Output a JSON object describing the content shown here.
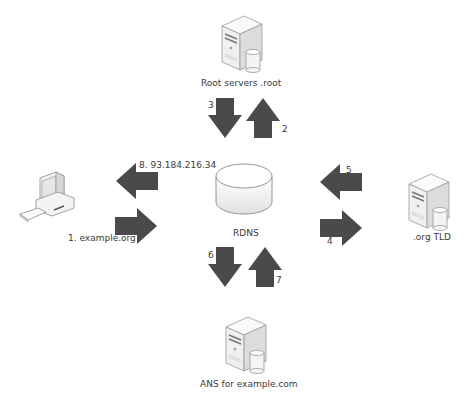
{
  "diagram": {
    "colors": {
      "arrow": "#4a4a4a",
      "server_face": "#f2f2f2",
      "server_side": "#d8d8d8",
      "outline": "#9a9a9a",
      "text": "#3a3a3a"
    },
    "nodes": {
      "root": {
        "label": "Root servers .root",
        "icon": "server-icon"
      },
      "client": {
        "label": "",
        "icon": "computer-icon"
      },
      "rdns": {
        "label": "RDNS",
        "icon": "database-cylinder-icon"
      },
      "tld": {
        "label": ".org TLD",
        "icon": "server-icon"
      },
      "ans": {
        "label": "ANS for example.com",
        "icon": "server-icon"
      }
    },
    "steps": [
      {
        "n": "1",
        "label": "1.  example.org",
        "from": "client",
        "to": "rdns",
        "direction": "right"
      },
      {
        "n": "2",
        "label": "2",
        "from": "rdns",
        "to": "root",
        "direction": "up"
      },
      {
        "n": "3",
        "label": "3",
        "from": "root",
        "to": "rdns",
        "direction": "down"
      },
      {
        "n": "4",
        "label": "4",
        "from": "rdns",
        "to": "tld",
        "direction": "right"
      },
      {
        "n": "5",
        "label": "5",
        "from": "tld",
        "to": "rdns",
        "direction": "left"
      },
      {
        "n": "6",
        "label": "6",
        "from": "rdns",
        "to": "ans",
        "direction": "down"
      },
      {
        "n": "7",
        "label": "7",
        "from": "ans",
        "to": "rdns",
        "direction": "up"
      },
      {
        "n": "8",
        "label": "8.  93.184.216.34",
        "from": "rdns",
        "to": "client",
        "direction": "left"
      }
    ]
  }
}
